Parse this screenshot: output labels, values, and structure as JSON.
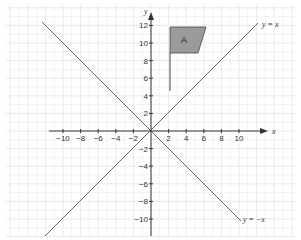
{
  "diagram": {
    "axes": {
      "x_label": "x",
      "y_label": "y",
      "x_ticks": [
        "-10",
        "-8",
        "-6",
        "-4",
        "-2",
        "2",
        "4",
        "6",
        "8",
        "10"
      ],
      "y_ticks": [
        "12",
        "10",
        "8",
        "6",
        "4",
        "2",
        "-2",
        "-4",
        "-6",
        "-8",
        "-10"
      ]
    },
    "lines": [
      {
        "label": "y = x"
      },
      {
        "label": "y = −x"
      }
    ],
    "shape": {
      "label": "A",
      "fill": "#9a9a9a"
    },
    "colors": {
      "grid": "#e4e4e4",
      "axis": "#333333",
      "line": "#666666"
    }
  }
}
